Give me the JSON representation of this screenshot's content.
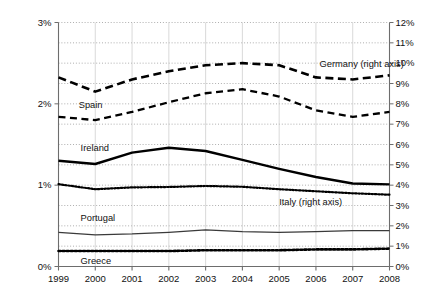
{
  "chart_data": {
    "type": "line",
    "title": "",
    "xlabel": "",
    "ylabel": "Share of global merchandise exports",
    "ylabel_right": "",
    "x": [
      1999,
      2000,
      2001,
      2002,
      2003,
      2004,
      2005,
      2006,
      2007,
      2008
    ],
    "xtick_labels": [
      "1999",
      "2000",
      "2001",
      "2002",
      "2003",
      "2004",
      "2005",
      "2006",
      "2007",
      "2008"
    ],
    "ylim_left": [
      0,
      3
    ],
    "ytick_labels_left": [
      "0%",
      "1%",
      "2%",
      "3%"
    ],
    "ytick_values_left": [
      0,
      1,
      2,
      3
    ],
    "ylim_right": [
      0,
      12
    ],
    "ytick_labels_right": [
      "0%",
      "1%",
      "2%",
      "3%",
      "4%",
      "5%",
      "6%",
      "7%",
      "8%",
      "9%",
      "10%",
      "11%",
      "12%"
    ],
    "ytick_values_right": [
      0,
      1,
      2,
      3,
      4,
      5,
      6,
      7,
      8,
      9,
      10,
      11,
      12
    ],
    "grid": true,
    "grid_style": "dotted-horizontal",
    "legend": "inline-annotations",
    "series": [
      {
        "name": "Germany (right axis)",
        "label": "Germany (right axis)",
        "axis": "right",
        "style": "long-dashed",
        "color": "#000000",
        "width": 2.6,
        "values": [
          9.3,
          8.6,
          9.2,
          9.6,
          9.9,
          10.0,
          9.9,
          9.3,
          9.2,
          9.4
        ],
        "label_x": 2006.1,
        "label_y": 9.9
      },
      {
        "name": "Spain",
        "label": "Spain",
        "axis": "left",
        "style": "dashed",
        "color": "#000000",
        "width": 2.3,
        "values": [
          1.84,
          1.8,
          1.9,
          2.02,
          2.13,
          2.18,
          2.09,
          1.92,
          1.84,
          1.9
        ],
        "label_x": 1999.55,
        "label_y": 1.97
      },
      {
        "name": "Ireland",
        "label": "Ireland",
        "axis": "left",
        "style": "solid",
        "color": "#000000",
        "width": 2.4,
        "values": [
          1.3,
          1.26,
          1.4,
          1.46,
          1.42,
          1.31,
          1.2,
          1.1,
          1.02,
          1.01
        ],
        "label_x": 1999.6,
        "label_y": 1.44
      },
      {
        "name": "Italy (right axis)",
        "label": "Italy (right axis)",
        "axis": "right",
        "style": "dotted",
        "color": "#000000",
        "width": 2.2,
        "values": [
          4.05,
          3.8,
          3.89,
          3.91,
          3.96,
          3.92,
          3.8,
          3.7,
          3.6,
          3.53
        ],
        "label_x": 2005.0,
        "label_y": 3.1
      },
      {
        "name": "Portugal",
        "label": "Portugal",
        "axis": "left",
        "style": "solid-thin",
        "color": "#3a3a3a",
        "width": 1.3,
        "values": [
          0.42,
          0.39,
          0.4,
          0.42,
          0.45,
          0.43,
          0.42,
          0.43,
          0.44,
          0.44
        ],
        "label_x": 1999.6,
        "label_y": 0.58
      },
      {
        "name": "Greece",
        "label": "Greece",
        "axis": "left",
        "style": "dotted-thick",
        "color": "#000000",
        "width": 2.6,
        "values": [
          0.19,
          0.19,
          0.19,
          0.19,
          0.2,
          0.2,
          0.2,
          0.21,
          0.21,
          0.22
        ],
        "label_x": 1999.6,
        "label_y": 0.06
      }
    ]
  }
}
